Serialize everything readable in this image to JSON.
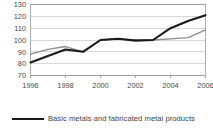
{
  "chart_data": {
    "type": "line",
    "title": "",
    "subtitle": "",
    "xlabel": "",
    "ylabel": "",
    "x": [
      1996,
      1997,
      1998,
      1999,
      2000,
      2001,
      2002,
      2003,
      2004,
      2005,
      2006
    ],
    "xtick_labels": [
      "1996",
      "1998",
      "2000",
      "2002",
      "2004",
      "2006"
    ],
    "xtick_values": [
      1996,
      1998,
      2000,
      2002,
      2004,
      2006
    ],
    "ytick_labels": [
      "70",
      "80",
      "90",
      "100",
      "110",
      "120",
      "130"
    ],
    "ytick_values": [
      70,
      80,
      90,
      100,
      110,
      120,
      130
    ],
    "xlim": [
      1996,
      2006
    ],
    "ylim": [
      70,
      130
    ],
    "grid": true,
    "grid_axis": "y",
    "legend_position": "bottom-left",
    "series": [
      {
        "name": "Basic metals and fabricated metal products",
        "color": "#1a1a1a",
        "in_legend": true,
        "values": [
          81,
          86.5,
          92,
          90,
          100,
          101,
          99.5,
          100,
          110,
          116,
          121
        ]
      },
      {
        "name": "",
        "color": "#8d8d8d",
        "in_legend": false,
        "values": [
          88,
          92,
          94.5,
          90,
          100,
          101,
          100,
          100,
          101,
          102,
          108.5
        ]
      }
    ]
  },
  "legend": {
    "entries": [
      {
        "label": "Basic metals and fabricated metal products",
        "color": "#1a1a1a"
      }
    ]
  },
  "colors": {
    "primary_series": "#1a1a1a",
    "secondary_series": "#8d8d8d",
    "gridline": "#c8c8c8",
    "axis": "#8a8a8a",
    "text": "#3f3f3f",
    "background": "#ffffff"
  }
}
